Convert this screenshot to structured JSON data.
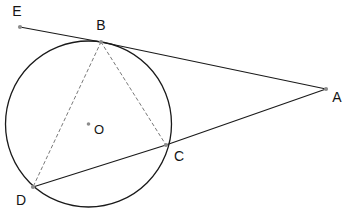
{
  "figure": {
    "kind": "circle-geometry-diagram",
    "width": 345,
    "height": 224,
    "background_color": "#ffffff"
  },
  "chart_data": {
    "type": "diagram",
    "title": "",
    "circle": {
      "label": "O",
      "center": {
        "x": 88.5,
        "y": 124.0
      },
      "radius": 83.0,
      "stroke": "#1a1a1a",
      "stroke_width": 1.3
    },
    "points": [
      {
        "label": "E",
        "x": 20.0,
        "y": 27.0,
        "label_x": 17.0,
        "label_y": 12.0,
        "on_circle": false,
        "marker": true
      },
      {
        "label": "B",
        "x": 101.0,
        "y": 42.0,
        "label_x": 101.0,
        "label_y": 26.0,
        "on_circle": true,
        "marker": true
      },
      {
        "label": "A",
        "x": 326.0,
        "y": 89.0,
        "label_x": 337.0,
        "label_y": 98.0,
        "on_circle": false,
        "marker": true
      },
      {
        "label": "C",
        "x": 166.0,
        "y": 145.0,
        "label_x": 179.0,
        "label_y": 157.0,
        "on_circle": true,
        "marker": true
      },
      {
        "label": "D",
        "x": 33.0,
        "y": 187.0,
        "label_x": 21.0,
        "label_y": 201.0,
        "on_circle": true,
        "marker": true
      },
      {
        "label": "O",
        "x": 88.5,
        "y": 124.0,
        "label_x": 99.0,
        "label_y": 131.0,
        "on_circle": false,
        "marker": true
      }
    ],
    "segments": [
      {
        "name": "EB",
        "from": "E",
        "to": "B",
        "style": "solid",
        "stroke": "#1a1a1a",
        "stroke_width": 1.2
      },
      {
        "name": "BA",
        "from": "B",
        "to": "A",
        "style": "solid",
        "stroke": "#1a1a1a",
        "stroke_width": 1.2
      },
      {
        "name": "AC",
        "from": "A",
        "to": "C",
        "style": "solid",
        "stroke": "#1a1a1a",
        "stroke_width": 1.2
      },
      {
        "name": "CD",
        "from": "C",
        "to": "D",
        "style": "solid",
        "stroke": "#1a1a1a",
        "stroke_width": 1.2
      },
      {
        "name": "BD",
        "from": "B",
        "to": "D",
        "style": "dashed",
        "stroke": "#7a7a7a",
        "stroke_width": 1.0
      },
      {
        "name": "BC",
        "from": "B",
        "to": "C",
        "style": "dashed",
        "stroke": "#7a7a7a",
        "stroke_width": 1.0
      }
    ],
    "marker_color": "#8c8c8c",
    "marker_radius": 2.1,
    "center_marker_radius": 1.8,
    "label_color": "#141414",
    "label_font_size": 14
  }
}
